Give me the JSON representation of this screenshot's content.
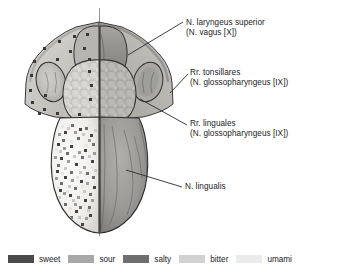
{
  "figure": {
    "midline_label": "median plane"
  },
  "labels": [
    {
      "id": "laryngeus",
      "line1": "N. laryngeus superior",
      "line2": "(N. vagus [X])",
      "target_x": 128,
      "target_y": 55
    },
    {
      "id": "tonsillares",
      "line1": "Rr. tonsillares",
      "line2": "(N. glossopharyngeus [IX])",
      "target_x": 171,
      "target_y": 92
    },
    {
      "id": "linguales",
      "line1": "Rr. linguales",
      "line2": "(N. glossopharyngeus [IX])",
      "target_x": 140,
      "target_y": 99
    },
    {
      "id": "lingualis",
      "line1": "N. lingualis",
      "line2": "",
      "target_x": 126,
      "target_y": 170
    }
  ],
  "legend": {
    "items": [
      {
        "label": "sweet",
        "color": "#4a4a4a"
      },
      {
        "label": "sour",
        "color": "#a8a8a8"
      },
      {
        "label": "salty",
        "color": "#6e6e6e"
      },
      {
        "label": "bitter",
        "color": "#d2d2d2"
      },
      {
        "label": "umami",
        "color": "#ebebeb"
      }
    ]
  },
  "colors": {
    "outline": "#2b2b2b",
    "leader_line": "#2b2b2b",
    "tongue_left": "#f2f1ee",
    "tongue_right": "#9a9a98",
    "root_fill": "#b9b8b4",
    "tonsil_fill": "#c9c8c3",
    "epiglottis_fill": "#8d8c89",
    "text": "#1b1b1b",
    "background": "#ffffff"
  }
}
